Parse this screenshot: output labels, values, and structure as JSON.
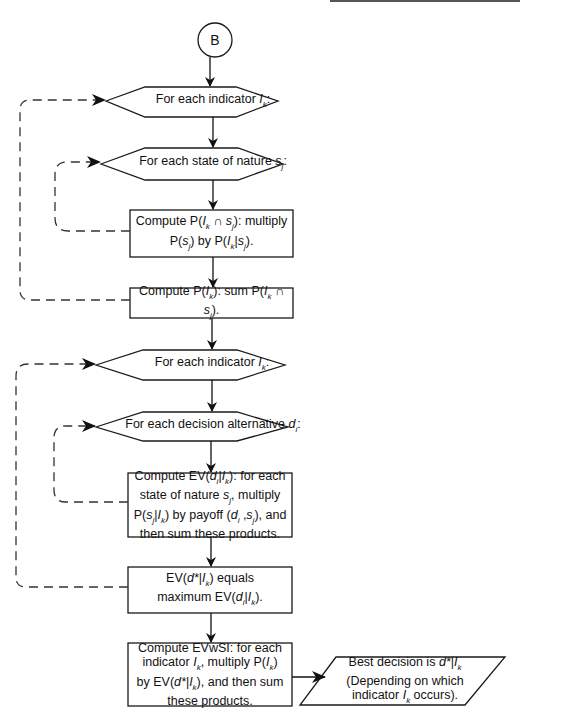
{
  "diagram": {
    "type": "flowchart",
    "connector": {
      "label": "B"
    },
    "nodes": [
      {
        "id": "loop-indicator-1",
        "shape": "hexagon",
        "text": "For each indicator I",
        "sub": "k",
        "tail": ":"
      },
      {
        "id": "loop-state",
        "shape": "hexagon",
        "text": "For each state of nature s",
        "sub": "j",
        "tail": ":"
      },
      {
        "id": "compute-joint",
        "shape": "rectangle",
        "lines": [
          "Compute P(Iₖ ∩ sⱼ): multiply",
          "P(sⱼ) by P(Iₖ|sⱼ)."
        ]
      },
      {
        "id": "compute-marginal",
        "shape": "rectangle",
        "lines": [
          "Compute P(Iₖ): sum P(Iₖ ∩ sⱼ)."
        ]
      },
      {
        "id": "loop-indicator-2",
        "shape": "hexagon",
        "text": "For each indicator I",
        "sub": "k",
        "tail": ":"
      },
      {
        "id": "loop-decision",
        "shape": "hexagon",
        "text": "For each decision alternative d",
        "sub": "i",
        "tail": ":"
      },
      {
        "id": "compute-ev",
        "shape": "rectangle",
        "lines": [
          "Compute EV(dᵢ|Iₖ): for each",
          "state of nature sⱼ, multiply",
          "P(sⱼ|Iₖ) by payoff (dᵢ ,sⱼ), and",
          "then sum these products."
        ]
      },
      {
        "id": "ev-max",
        "shape": "rectangle",
        "lines": [
          "EV(d*|Iₖ) equals",
          "maximum EV(dᵢ|Iₖ)."
        ]
      },
      {
        "id": "compute-evwsi",
        "shape": "rectangle",
        "lines": [
          "Compute EVwSI: for each",
          "indicator Iₖ, multiply P(Iₖ)",
          "by EV(d*|Iₖ), and then sum",
          "these products."
        ]
      },
      {
        "id": "output-best",
        "shape": "parallelogram",
        "lines": [
          "Best decision is d*|Iₖ",
          "(Depending on which",
          "indicator Iₖ occurs)."
        ]
      }
    ],
    "edges": [
      {
        "from": "B",
        "to": "loop-indicator-1",
        "style": "solid"
      },
      {
        "from": "loop-indicator-1",
        "to": "loop-state",
        "style": "solid"
      },
      {
        "from": "loop-state",
        "to": "compute-joint",
        "style": "solid"
      },
      {
        "from": "compute-joint",
        "to": "compute-marginal",
        "style": "solid"
      },
      {
        "from": "compute-joint",
        "to": "loop-state",
        "style": "dashed"
      },
      {
        "from": "compute-marginal",
        "to": "loop-indicator-1",
        "style": "dashed"
      },
      {
        "from": "compute-marginal",
        "to": "loop-indicator-2",
        "style": "solid"
      },
      {
        "from": "loop-indicator-2",
        "to": "loop-decision",
        "style": "solid"
      },
      {
        "from": "loop-decision",
        "to": "compute-ev",
        "style": "solid"
      },
      {
        "from": "compute-ev",
        "to": "loop-decision",
        "style": "dashed"
      },
      {
        "from": "compute-ev",
        "to": "ev-max",
        "style": "solid"
      },
      {
        "from": "ev-max",
        "to": "loop-indicator-2",
        "style": "dashed"
      },
      {
        "from": "ev-max",
        "to": "compute-evwsi",
        "style": "solid"
      },
      {
        "from": "compute-evwsi",
        "to": "output-best",
        "style": "solid"
      }
    ],
    "colors": {
      "stroke": "#1a1a1a",
      "fill": "#ffffff",
      "dash": "#333333"
    }
  },
  "text": {
    "connector": "B",
    "hex1": {
      "pre": "For each indicator ",
      "var": "I",
      "sub": "k",
      "post": ":"
    },
    "hex2": {
      "pre": "For each state of nature ",
      "var": "s",
      "sub": "j",
      "post": ":"
    },
    "rect1": {
      "a": "Compute P(",
      "b": "I",
      "c": "k",
      "d": " ∩ ",
      "e": "s",
      "f": "j",
      "g": "): multiply",
      "h": "P(",
      "i": "s",
      "j": "j",
      "k": ") by P(",
      "l": "I",
      "m": "k",
      "n": "|",
      "o": "s",
      "p": "j",
      "q": ")."
    },
    "rect2": {
      "a": "Compute P(",
      "b": "I",
      "c": "k",
      "d": "): sum P(",
      "e": "I",
      "f": "k",
      "g": " ∩ ",
      "h": "s",
      "i": "j",
      "j": ")."
    },
    "hex3": {
      "pre": "For each indicator ",
      "var": "I",
      "sub": "k",
      "post": ":"
    },
    "hex4": {
      "pre": "For each decision alternative ",
      "var": "d",
      "sub": "i",
      "post": ":"
    },
    "rect3": {
      "l1a": "Compute EV(",
      "l1b": "d",
      "l1c": "i",
      "l1d": "|",
      "l1e": "I",
      "l1f": "k",
      "l1g": "): for each",
      "l2a": "state of nature ",
      "l2b": "s",
      "l2c": "j",
      "l2d": ", multiply",
      "l3a": "P(",
      "l3b": "s",
      "l3c": "j",
      "l3d": "|",
      "l3e": "I",
      "l3f": "k",
      "l3g": ") by payoff (",
      "l3h": "d",
      "l3i": "i",
      "l3j": " ,",
      "l3k": "s",
      "l3l": "j",
      "l3m": "), and",
      "l4": "then sum these products."
    },
    "rect4": {
      "l1a": "EV(",
      "l1b": "d*",
      "l1c": "|",
      "l1d": "I",
      "l1e": "k",
      "l1f": ") equals",
      "l2a": "maximum EV(",
      "l2b": "d",
      "l2c": "i",
      "l2d": "|",
      "l2e": "I",
      "l2f": "k",
      "l2g": ")."
    },
    "rect5": {
      "l1": "Compute EVwSI: for each",
      "l2a": "indicator ",
      "l2b": "I",
      "l2c": "k",
      "l2d": ", multiply P(",
      "l2e": "I",
      "l2f": "k",
      "l2g": ")",
      "l3a": "by EV(",
      "l3b": "d*",
      "l3c": "|",
      "l3d": "I",
      "l3e": "k",
      "l3f": "), and then sum",
      "l4": "these products."
    },
    "para": {
      "l1a": "Best decision is ",
      "l1b": "d*",
      "l1c": "|",
      "l1d": "I",
      "l1e": "k",
      "l2": "(Depending on which",
      "l3a": "indicator ",
      "l3b": "I",
      "l3c": "k",
      "l3d": " occurs)."
    }
  }
}
